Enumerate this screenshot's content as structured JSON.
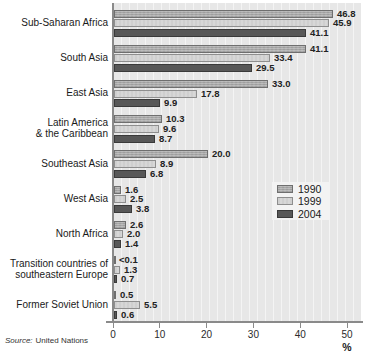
{
  "chart_data": {
    "type": "bar",
    "orientation": "horizontal",
    "title": "",
    "xlabel": "%",
    "xlim": [
      0,
      50
    ],
    "xticks": [
      0,
      10,
      20,
      30,
      40,
      50
    ],
    "x_tick_labels": [
      "0",
      "10",
      "20",
      "30",
      "40",
      "50"
    ],
    "grid": false,
    "legend_position": "center-right",
    "categories": [
      "Sub-Saharan Africa",
      "South Asia",
      "East Asia",
      "Latin America & the Caribbean",
      "Southeast Asia",
      "West Asia",
      "North Africa",
      "Transition countries of southeastern Europe",
      "Former Soviet Union"
    ],
    "category_label_lines": [
      [
        "Sub-Saharan Africa"
      ],
      [
        "South Asia"
      ],
      [
        "East Asia"
      ],
      [
        "Latin America",
        "& the Caribbean"
      ],
      [
        "Southeast Asia"
      ],
      [
        "West Asia"
      ],
      [
        "North Africa"
      ],
      [
        "Transition countries of",
        "southeastern Europe"
      ],
      [
        "Former Soviet Union"
      ]
    ],
    "series": [
      {
        "name": "1990",
        "color": "#a7a7a7",
        "border_color": "#6f6f6f",
        "values": [
          46.8,
          41.1,
          33.0,
          10.3,
          20.0,
          1.6,
          2.6,
          0.05,
          0.5
        ],
        "value_labels": [
          "46.8",
          "41.1",
          "33.0",
          "10.3",
          "20.0",
          "1.6",
          "2.6",
          "<0.1",
          "0.5"
        ]
      },
      {
        "name": "1999",
        "color": "#d7d7d7",
        "border_color": "#8e8e8e",
        "values": [
          45.9,
          33.4,
          17.8,
          9.6,
          8.9,
          2.5,
          2.0,
          1.3,
          5.5
        ],
        "value_labels": [
          "45.9",
          "33.4",
          "17.8",
          "9.6",
          "8.9",
          "2.5",
          "2.0",
          "1.3",
          "5.5"
        ]
      },
      {
        "name": "2004",
        "color": "#585858",
        "border_color": "#3a3a3a",
        "values": [
          41.1,
          29.5,
          9.9,
          8.7,
          6.8,
          3.8,
          1.4,
          0.7,
          0.6
        ],
        "value_labels": [
          "41.1",
          "29.5",
          "9.9",
          "8.7",
          "6.8",
          "3.8",
          "1.4",
          "0.7",
          "0.6"
        ]
      }
    ]
  },
  "legend": {
    "items": [
      {
        "label": "1990"
      },
      {
        "label": "1999"
      },
      {
        "label": "2004"
      }
    ]
  },
  "source": {
    "prefix": "Source:",
    "text": "United Nations"
  },
  "colors": {
    "plot_background": "#e7e7e7",
    "axis": "#8a8a8a",
    "legend_background": "#f3f3f3",
    "text": "#1a1a1a",
    "series_1990": "#a7a7a7",
    "series_1999": "#d7d7d7",
    "series_2004": "#585858"
  }
}
